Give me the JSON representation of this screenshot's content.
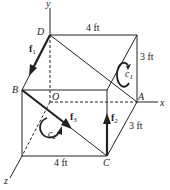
{
  "diagram": {
    "type": "3D box with forces and couples",
    "axes": {
      "x": "x",
      "y": "y",
      "z": "z"
    },
    "points": {
      "origin": "O",
      "A": "A",
      "B": "B",
      "C": "C",
      "D": "D"
    },
    "dimensions": {
      "top_width": "4 ft",
      "bottom_width": "4 ft",
      "height": "3 ft",
      "depth": "3 ft"
    },
    "forces": {
      "f1": "f",
      "f1_sub": "1",
      "f2": "f",
      "f2_sub": "2",
      "f3": "f",
      "f3_sub": "3"
    },
    "couples": {
      "c1": "c",
      "c1_sub": "1",
      "c2": "c",
      "c2_sub": "2"
    },
    "colors": {
      "line": "#222222",
      "background": "#ffffff"
    }
  }
}
